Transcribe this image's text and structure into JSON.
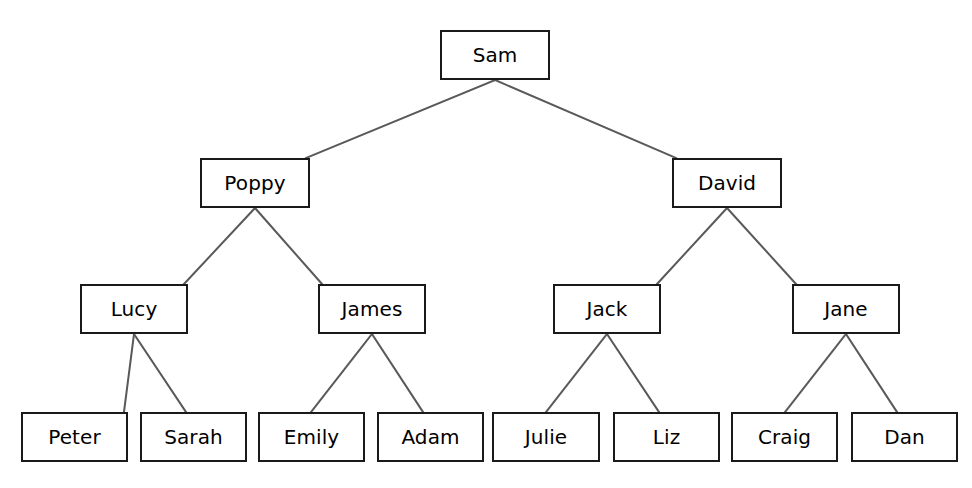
{
  "diagram": {
    "type": "binary-tree",
    "background_color": "#ffffff",
    "node_border_color": "#1a1a1a",
    "node_fill_color": "#ffffff",
    "node_text_color": "#000000",
    "edge_color": "#595959",
    "levels": 4,
    "node_count": 15,
    "edge_count": 14
  },
  "nodes": [
    {
      "id": "sam",
      "label": "Sam",
      "level": 0,
      "x": 440,
      "y": 30,
      "w": 110,
      "h": 50
    },
    {
      "id": "poppy",
      "label": "Poppy",
      "level": 1,
      "x": 200,
      "y": 158,
      "w": 110,
      "h": 50
    },
    {
      "id": "david",
      "label": "David",
      "level": 1,
      "x": 672,
      "y": 158,
      "w": 110,
      "h": 50
    },
    {
      "id": "lucy",
      "label": "Lucy",
      "level": 2,
      "x": 80,
      "y": 284,
      "w": 108,
      "h": 50
    },
    {
      "id": "james",
      "label": "James",
      "level": 2,
      "x": 318,
      "y": 284,
      "w": 108,
      "h": 50
    },
    {
      "id": "jack",
      "label": "Jack",
      "level": 2,
      "x": 553,
      "y": 284,
      "w": 108,
      "h": 50
    },
    {
      "id": "jane",
      "label": "Jane",
      "level": 2,
      "x": 792,
      "y": 284,
      "w": 108,
      "h": 50
    },
    {
      "id": "peter",
      "label": "Peter",
      "level": 3,
      "x": 21,
      "y": 412,
      "w": 107,
      "h": 50
    },
    {
      "id": "sarah",
      "label": "Sarah",
      "level": 3,
      "x": 140,
      "y": 412,
      "w": 107,
      "h": 50
    },
    {
      "id": "emily",
      "label": "Emily",
      "level": 3,
      "x": 258,
      "y": 412,
      "w": 107,
      "h": 50
    },
    {
      "id": "adam",
      "label": "Adam",
      "level": 3,
      "x": 377,
      "y": 412,
      "w": 107,
      "h": 50
    },
    {
      "id": "julie",
      "label": "Julie",
      "level": 3,
      "x": 492,
      "y": 412,
      "w": 108,
      "h": 50
    },
    {
      "id": "liz",
      "label": "Liz",
      "level": 3,
      "x": 613,
      "y": 412,
      "w": 107,
      "h": 50
    },
    {
      "id": "craig",
      "label": "Craig",
      "level": 3,
      "x": 731,
      "y": 412,
      "w": 107,
      "h": 50
    },
    {
      "id": "dan",
      "label": "Dan",
      "level": 3,
      "x": 851,
      "y": 412,
      "w": 107,
      "h": 50
    }
  ],
  "edges": [
    {
      "from": "sam",
      "to": "poppy",
      "x1": 495,
      "y1": 80,
      "x2": 306,
      "y2": 158
    },
    {
      "from": "sam",
      "to": "david",
      "x1": 495,
      "y1": 80,
      "x2": 676,
      "y2": 158
    },
    {
      "from": "poppy",
      "to": "lucy",
      "x1": 255,
      "y1": 208,
      "x2": 184,
      "y2": 284
    },
    {
      "from": "poppy",
      "to": "james",
      "x1": 255,
      "y1": 208,
      "x2": 322,
      "y2": 284
    },
    {
      "from": "david",
      "to": "jack",
      "x1": 727,
      "y1": 208,
      "x2": 657,
      "y2": 284
    },
    {
      "from": "david",
      "to": "jane",
      "x1": 727,
      "y1": 208,
      "x2": 796,
      "y2": 284
    },
    {
      "from": "lucy",
      "to": "peter",
      "x1": 134,
      "y1": 334,
      "x2": 124,
      "y2": 412
    },
    {
      "from": "lucy",
      "to": "sarah",
      "x1": 134,
      "y1": 334,
      "x2": 186,
      "y2": 412
    },
    {
      "from": "james",
      "to": "emily",
      "x1": 372,
      "y1": 334,
      "x2": 311,
      "y2": 412
    },
    {
      "from": "james",
      "to": "adam",
      "x1": 372,
      "y1": 334,
      "x2": 423,
      "y2": 412
    },
    {
      "from": "jack",
      "to": "julie",
      "x1": 607,
      "y1": 334,
      "x2": 546,
      "y2": 412
    },
    {
      "from": "jack",
      "to": "liz",
      "x1": 607,
      "y1": 334,
      "x2": 659,
      "y2": 412
    },
    {
      "from": "jane",
      "to": "craig",
      "x1": 846,
      "y1": 334,
      "x2": 785,
      "y2": 412
    },
    {
      "from": "jane",
      "to": "dan",
      "x1": 846,
      "y1": 334,
      "x2": 897,
      "y2": 412
    }
  ]
}
